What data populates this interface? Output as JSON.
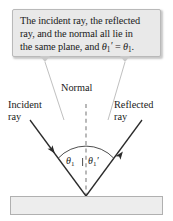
{
  "figure": {
    "width": 173,
    "height": 221
  },
  "callout": {
    "line1": "The incident ray, the reflected",
    "line2": "ray, and the normal all lie in",
    "line3_prefix": "the same plane, and ",
    "theta_prime_symbol": "θ",
    "theta_prime_sub": "1",
    "theta_prime_mark": "′",
    "equals": " = ",
    "theta_symbol": "θ",
    "theta_sub": "1",
    "period": ".",
    "background_color": "#e9e9e9",
    "border_color": "#b9b9b9"
  },
  "labels": {
    "normal": "Normal",
    "incident_line1": "Incident",
    "incident_line2": "ray",
    "reflected_line1": "Reflected",
    "reflected_line2": "ray"
  },
  "angles": {
    "incident_symbol": "θ",
    "incident_sub": "1",
    "reflected_symbol": "θ",
    "reflected_sub": "1",
    "reflected_mark": "′"
  },
  "colors": {
    "ray_stroke": "#2b2b2b",
    "normal_dash": "#8a8a8a",
    "leader_line": "#c0c0c0",
    "surface_fill": "#ededed",
    "surface_border": "#b0b0b0",
    "arc_stroke": "#3a3a3a",
    "text": "#1a1a1a"
  },
  "geometry": {
    "vertex_x": 86,
    "vertex_y": 196,
    "incident_start_x": 30,
    "incident_start_y": 120,
    "reflected_end_x": 142,
    "reflected_end_y": 120,
    "normal_top_y": 104,
    "arc_radius": 38
  }
}
